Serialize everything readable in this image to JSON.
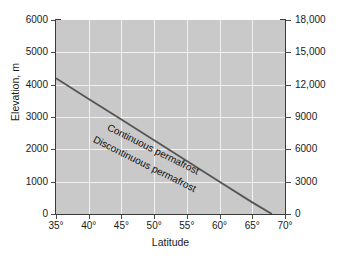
{
  "chart_data": {
    "type": "line",
    "title": "",
    "xlabel": "Latitude",
    "ylabel": "Elevation, m",
    "ylabel_right": "",
    "xlim": [
      35,
      70
    ],
    "ylim": [
      0,
      6000
    ],
    "ylim_right": [
      0,
      18000
    ],
    "grid": true,
    "legend": "none",
    "background": "#c9c9c9",
    "gridline_color": "#f2f2f2",
    "line_color": "#555555",
    "x_ticks": [
      "35°",
      "40°",
      "45°",
      "50°",
      "55°",
      "60°",
      "65°",
      "70°"
    ],
    "x_tick_values": [
      35,
      40,
      45,
      50,
      55,
      60,
      65,
      70
    ],
    "y_ticks_left": [
      "0",
      "1000",
      "2000",
      "3000",
      "4000",
      "5000",
      "6000"
    ],
    "y_tick_values_left": [
      0,
      1000,
      2000,
      3000,
      4000,
      5000,
      6000
    ],
    "y_ticks_right": [
      "0",
      "3000",
      "6000",
      "9000",
      "12,000",
      "15,000",
      "18,000"
    ],
    "y_tick_values_right": [
      0,
      3000,
      6000,
      9000,
      12000,
      15000,
      18000
    ],
    "series": [
      {
        "name": "Permafrost boundary",
        "x": [
          35,
          40,
          45,
          50,
          55,
          60,
          65,
          68
        ],
        "values": [
          4200,
          3560,
          2920,
          2280,
          1640,
          1000,
          360,
          0
        ]
      }
    ],
    "annotations": [
      {
        "text": "Continuous permafrost",
        "position": "above-line",
        "rotation_deg": 26.5
      },
      {
        "text": "Discontinuous permafrost",
        "position": "below-line",
        "rotation_deg": 26.5
      }
    ]
  }
}
